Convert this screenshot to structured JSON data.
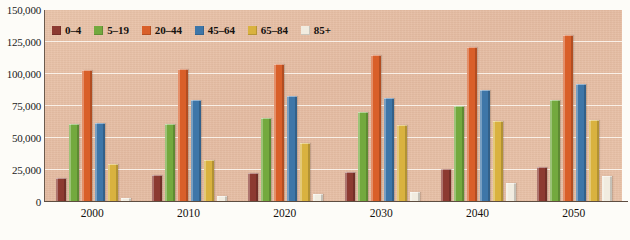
{
  "chart_data": {
    "type": "bar",
    "title": "",
    "subtitle": "",
    "xlabel": "",
    "ylabel": "",
    "categories": [
      "2000",
      "2010",
      "2020",
      "2030",
      "2040",
      "2050"
    ],
    "ylim": [
      0,
      150000
    ],
    "ytick_values": [
      0,
      25000,
      50000,
      75000,
      100000,
      125000,
      150000
    ],
    "ytick_labels": [
      "0",
      "25,000",
      "50,000",
      "75,000",
      "100,000",
      "125,000",
      "150,000"
    ],
    "grid": true,
    "legend_position": "top-left-inside",
    "series": [
      {
        "name": "0–4",
        "color": "#8c3a31",
        "values": [
          19000,
          21000,
          22500,
          23500,
          25500,
          27000
        ]
      },
      {
        "name": "5–19",
        "color": "#73a93e",
        "values": [
          61000,
          61000,
          65500,
          70500,
          75000,
          80000
        ]
      },
      {
        "name": "20–44",
        "color": "#d95f29",
        "values": [
          103500,
          104000,
          107500,
          115000,
          121000,
          130500
        ]
      },
      {
        "name": "45–64",
        "color": "#3e76a8",
        "values": [
          62000,
          80000,
          83000,
          81500,
          87500,
          92500
        ]
      },
      {
        "name": "65–84",
        "color": "#d9b23f",
        "values": [
          29500,
          32500,
          46000,
          60500,
          63000,
          64000
        ]
      },
      {
        "name": "85+",
        "color": "#f1ece0",
        "values": [
          3500,
          5000,
          6500,
          8000,
          15000,
          20000
        ]
      }
    ]
  },
  "legend": {
    "items": [
      {
        "label": "0–4"
      },
      {
        "label": "5–19"
      },
      {
        "label": "20–44"
      },
      {
        "label": "45–64"
      },
      {
        "label": "65–84"
      },
      {
        "label": "85+"
      }
    ]
  },
  "colors": {
    "plot_background": "#e7bfa5",
    "gridline": "#fffcf7",
    "axis": "#5d4d41",
    "page_background": "#fdfcf8"
  }
}
